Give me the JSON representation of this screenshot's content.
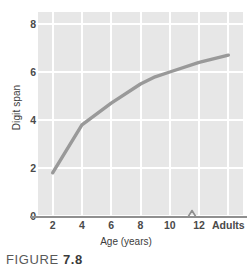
{
  "figure": {
    "caption_label": "FIGURE",
    "caption_number": "7.8"
  },
  "colors": {
    "plot_background": "#e7e7e7",
    "gridline": "#ffffff",
    "line_series": "#999999",
    "axis": "#8f8f8f",
    "tick_text": "#4a4a4a",
    "title_text": "#3c3c3c",
    "page_background": "#ffffff"
  },
  "chart_data": {
    "type": "line",
    "title": "",
    "xlabel": "Age (years)",
    "ylabel": "Digit span",
    "x": [
      2,
      4,
      6,
      8,
      9,
      10,
      12,
      14
    ],
    "values": [
      1.8,
      3.8,
      4.7,
      5.5,
      5.8,
      6.0,
      6.4,
      6.7
    ],
    "series": [
      {
        "name": "Digit span",
        "color": "#999999",
        "points": [
          {
            "x": 2,
            "y": 1.8
          },
          {
            "x": 4,
            "y": 3.8
          },
          {
            "x": 6,
            "y": 4.7
          },
          {
            "x": 8,
            "y": 5.5
          },
          {
            "x": 9,
            "y": 5.8
          },
          {
            "x": 10,
            "y": 6.0
          },
          {
            "x": 12,
            "y": 6.4
          },
          {
            "x": 14,
            "y": 6.7
          }
        ]
      }
    ],
    "xlim": [
      1,
      15
    ],
    "ylim": [
      0,
      8.5
    ],
    "x_tick_values": [
      2,
      4,
      6,
      8,
      10,
      12,
      14
    ],
    "x_tick_labels": [
      "2",
      "4",
      "6",
      "8",
      "10",
      "12",
      "Adults"
    ],
    "y_tick_values": [
      0,
      2,
      4,
      6,
      8
    ],
    "y_tick_labels": [
      "0",
      "2",
      "4",
      "6",
      "8"
    ],
    "grid": true,
    "grid_orientation": "both",
    "legend": false,
    "legend_position": "none",
    "axis_break": {
      "axis": "x",
      "style": "zigzag",
      "between_labels": [
        "12",
        "Adults"
      ]
    },
    "annotations": []
  }
}
